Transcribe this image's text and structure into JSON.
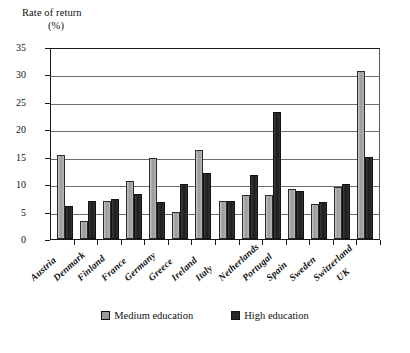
{
  "chart_data": {
    "type": "bar",
    "title": "Rate of return (%)",
    "ylabel_line1": "Rate of return",
    "ylabel_line2": "(%)",
    "xlabel": "",
    "ylim": [
      0,
      35
    ],
    "yticks": [
      0,
      5,
      10,
      15,
      20,
      25,
      30,
      35
    ],
    "grid": true,
    "legend_position": "bottom",
    "categories": [
      "Austria",
      "Denmark",
      "Finland",
      "France",
      "Germany",
      "Greece",
      "Ireland",
      "Italy",
      "Netherlands",
      "Portugal",
      "Spain",
      "Sweden",
      "Switzerland",
      "UK"
    ],
    "series": [
      {
        "name": "Medium education",
        "color": "#9b9b9b",
        "values": [
          15.3,
          3.3,
          7.0,
          10.5,
          14.8,
          5.0,
          16.2,
          7.0,
          8.0,
          8.0,
          9.2,
          6.3,
          9.5,
          30.7
        ]
      },
      {
        "name": "High education",
        "color": "#262626",
        "values": [
          6.0,
          7.0,
          7.3,
          8.2,
          6.7,
          10.0,
          12.0,
          7.0,
          11.6,
          23.2,
          8.8,
          6.7,
          10.0,
          15.0
        ]
      }
    ]
  },
  "legend": {
    "items": [
      {
        "label": "Medium education"
      },
      {
        "label": "High education"
      }
    ]
  }
}
